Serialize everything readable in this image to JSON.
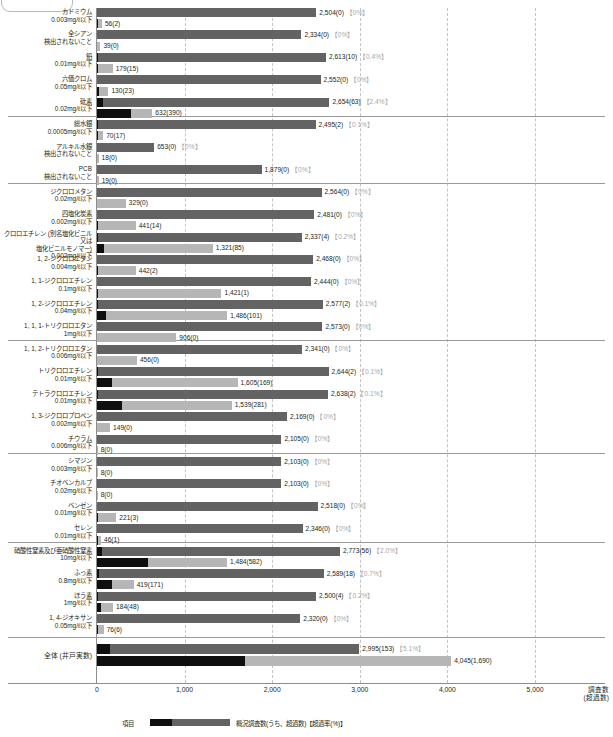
{
  "axis": {
    "ticks": [
      {
        "label": "0",
        "value": 0
      },
      {
        "label": "1,000",
        "value": 1000
      },
      {
        "label": "2,000",
        "value": 2000
      },
      {
        "label": "3,000",
        "value": 3000
      },
      {
        "label": "4,000",
        "value": 4000
      },
      {
        "label": "5,000",
        "value": 5000
      }
    ],
    "title_line1": "調査数",
    "title_line2": "(超過数)",
    "xmin": 0,
    "xmax": 5500
  },
  "legend": {
    "term": "項目",
    "text": "概況調査数(うち、超過数)【超過率(%)】"
  },
  "total": {
    "label": "全体 (井戸実数)",
    "survey_text": "2,995(153)",
    "survey_pct": "【5.1%】",
    "survey_value": 2995,
    "survey_exceed": 153,
    "detect_text": "4,045(1,690)",
    "detect_value": 4045,
    "detect_exceed": 1690
  },
  "colors": {
    "survey_bar": "#636363",
    "detect_bar": "#b6b6b6",
    "exceed_bar": "#0f0f0f",
    "gridline": "#c4c4c4",
    "axis": "#8d8d8d",
    "pct_text": "#a8a8a8"
  },
  "chart_data": {
    "type": "bar",
    "title": "",
    "xlabel": "調査数 (超過数)",
    "ylabel": "項目",
    "xlim": [
      0,
      5500
    ],
    "grid": true,
    "orientation": "horizontal",
    "series": [
      {
        "name": "概況調査数(うち、超過数)",
        "key": "survey"
      },
      {
        "name": "検出数(うち、超過数)",
        "key": "detect"
      }
    ],
    "categories": [
      "カドミウム",
      "全シアン",
      "鉛",
      "六価クロム",
      "砒素",
      "総水銀",
      "アルキル水銀",
      "PCB",
      "ジクロロメタン",
      "四塩化炭素",
      "クロロエチレン (別名塩化ビニル又は塩化ビニルモノマー)",
      "1, 2-ジクロロエタン",
      "1, 1-ジクロロエチレン",
      "1, 2-ジクロロエチレン",
      "1, 1, 1-トリクロロエタン",
      "1, 1, 2-トリクロロエタン",
      "トリクロロエチレン",
      "テトラクロロエチレン",
      "1, 3-ジクロロプロペン",
      "チウラム",
      "シマジン",
      "チオベンカルブ",
      "ベンゼン",
      "セレン",
      "硝酸性窒素及び亜硝酸性窒素",
      "ふっ素",
      "ほう素",
      "1, 4-ジオキサン",
      "全体 (井戸実数)"
    ],
    "rows": [
      {
        "name": "カドミウム",
        "std": "0.003mg/ℓ以下",
        "survey_value": 2504,
        "survey_exceed": 0,
        "survey_text": "2,504(0)",
        "survey_pct": "【0%】",
        "detect_value": 56,
        "detect_exceed": 2,
        "detect_text": "56(2)",
        "section": 0
      },
      {
        "name": "全シアン",
        "std": "検出されないこと",
        "survey_value": 2334,
        "survey_exceed": 0,
        "survey_text": "2,334(0)",
        "survey_pct": "【0%】",
        "detect_value": 39,
        "detect_exceed": 0,
        "detect_text": "39(0)",
        "section": 0
      },
      {
        "name": "鉛",
        "std": "0.01mg/ℓ以下",
        "survey_value": 2613,
        "survey_exceed": 10,
        "survey_text": "2,613(10)",
        "survey_pct": "【0.4%】",
        "detect_value": 179,
        "detect_exceed": 15,
        "detect_text": "179(15)",
        "section": 0
      },
      {
        "name": "六価クロム",
        "std": "0.05mg/ℓ以下",
        "survey_value": 2552,
        "survey_exceed": 0,
        "survey_text": "2,552(0)",
        "survey_pct": "【0%】",
        "detect_value": 130,
        "detect_exceed": 23,
        "detect_text": "130(23)",
        "section": 0
      },
      {
        "name": "砒素",
        "std": "0.02mg/ℓ以下",
        "survey_value": 2654,
        "survey_exceed": 63,
        "survey_text": "2,654(63)",
        "survey_pct": "【2.4%】",
        "detect_value": 632,
        "detect_exceed": 390,
        "detect_text": "632(390)",
        "section": 0
      },
      {
        "name": "総水銀",
        "std": "0.0005mg/ℓ以下",
        "survey_value": 2495,
        "survey_exceed": 2,
        "survey_text": "2,495(2)",
        "survey_pct": "【0.1%】",
        "detect_value": 70,
        "detect_exceed": 17,
        "detect_text": "70(17)",
        "section": 1
      },
      {
        "name": "アルキル水銀",
        "std": "検出されないこと",
        "survey_value": 653,
        "survey_exceed": 0,
        "survey_text": "653(0)",
        "survey_pct": "【0%】",
        "detect_value": 18,
        "detect_exceed": 0,
        "detect_text": "18(0)",
        "section": 1
      },
      {
        "name": "PCB",
        "std": "検出されないこと",
        "survey_value": 1879,
        "survey_exceed": 0,
        "survey_text": "1,879(0)",
        "survey_pct": "【0%】",
        "detect_value": 19,
        "detect_exceed": 0,
        "detect_text": "19(0)",
        "section": 1
      },
      {
        "name": "ジクロロメタン",
        "std": "0.02mg/ℓ以下",
        "survey_value": 2564,
        "survey_exceed": 0,
        "survey_text": "2,564(0)",
        "survey_pct": "【0%】",
        "detect_value": 329,
        "detect_exceed": 0,
        "detect_text": "329(0)",
        "section": 2
      },
      {
        "name": "四塩化炭素",
        "std": "0.002mg/ℓ以下",
        "survey_value": 2481,
        "survey_exceed": 0,
        "survey_text": "2,481(0)",
        "survey_pct": "【0%】",
        "detect_value": 441,
        "detect_exceed": 14,
        "detect_text": "441(14)",
        "section": 2
      },
      {
        "name": "クロロエチレン (別名塩化ビニル又は",
        "name2": "塩化ビニルモノマー)",
        "std": "0.002mg/ℓ以下",
        "survey_value": 2337,
        "survey_exceed": 4,
        "survey_text": "2,337(4)",
        "survey_pct": "【0.2%】",
        "detect_value": 1321,
        "detect_exceed": 85,
        "detect_text": "1,321(85)",
        "section": 2
      },
      {
        "name": "1, 2-ジクロロエタン",
        "std": "0.004mg/ℓ以下",
        "survey_value": 2468,
        "survey_exceed": 0,
        "survey_text": "2,468(0)",
        "survey_pct": "【0%】",
        "detect_value": 442,
        "detect_exceed": 2,
        "detect_text": "442(2)",
        "section": 2
      },
      {
        "name": "1, 1-ジクロロエチレン",
        "std": "0.1mg/ℓ以下",
        "survey_value": 2444,
        "survey_exceed": 0,
        "survey_text": "2,444(0)",
        "survey_pct": "【0%】",
        "detect_value": 1421,
        "detect_exceed": 1,
        "detect_text": "1,421(1)",
        "section": 2
      },
      {
        "name": "1, 2-ジクロロエチレン",
        "std": "0.04mg/ℓ以下",
        "survey_value": 2577,
        "survey_exceed": 2,
        "survey_text": "2,577(2)",
        "survey_pct": "【0.1%】",
        "detect_value": 1486,
        "detect_exceed": 101,
        "detect_text": "1,486(101)",
        "section": 2
      },
      {
        "name": "1, 1, 1-トリクロロエタン",
        "std": "1mg/ℓ以下",
        "survey_value": 2573,
        "survey_exceed": 0,
        "survey_text": "2,573(0)",
        "survey_pct": "【0%】",
        "detect_value": 906,
        "detect_exceed": 0,
        "detect_text": "906(0)",
        "section": 2
      },
      {
        "name": "1, 1, 2-トリクロロエタン",
        "std": "0.006mg/ℓ以下",
        "survey_value": 2341,
        "survey_exceed": 0,
        "survey_text": "2,341(0)",
        "survey_pct": "【0%】",
        "detect_value": 456,
        "detect_exceed": 0,
        "detect_text": "456(0)",
        "section": 3
      },
      {
        "name": "トリクロロエチレン",
        "std": "0.01mg/ℓ以下",
        "survey_value": 2644,
        "survey_exceed": 2,
        "survey_text": "2,644(2)",
        "survey_pct": "【0.1%】",
        "detect_value": 1605,
        "detect_exceed": 169,
        "detect_text": "1,605(169)",
        "section": 3
      },
      {
        "name": "テトラクロロエチレン",
        "std": "0.01mg/ℓ以下",
        "survey_value": 2638,
        "survey_exceed": 2,
        "survey_text": "2,638(2)",
        "survey_pct": "【0.1%】",
        "detect_value": 1539,
        "detect_exceed": 281,
        "detect_text": "1,539(281)",
        "section": 3
      },
      {
        "name": "1, 3-ジクロロプロペン",
        "std": "0.002mg/ℓ以下",
        "survey_value": 2169,
        "survey_exceed": 0,
        "survey_text": "2,169(0)",
        "survey_pct": "【0%】",
        "detect_value": 149,
        "detect_exceed": 0,
        "detect_text": "149(0)",
        "section": 3
      },
      {
        "name": "チウラム",
        "std": "0.006mg/ℓ以下",
        "survey_value": 2105,
        "survey_exceed": 0,
        "survey_text": "2,105(0)",
        "survey_pct": "【0%】",
        "detect_value": 8,
        "detect_exceed": 0,
        "detect_text": "8(0)",
        "section": 3
      },
      {
        "name": "シマジン",
        "std": "0.003mg/ℓ以下",
        "survey_value": 2103,
        "survey_exceed": 0,
        "survey_text": "2,103(0)",
        "survey_pct": "【0%】",
        "detect_value": 8,
        "detect_exceed": 0,
        "detect_text": "8(0)",
        "section": 4
      },
      {
        "name": "チオベンカルブ",
        "std": "0.02mg/ℓ以下",
        "survey_value": 2103,
        "survey_exceed": 0,
        "survey_text": "2,103(0)",
        "survey_pct": "【0%】",
        "detect_value": 8,
        "detect_exceed": 0,
        "detect_text": "8(0)",
        "section": 4
      },
      {
        "name": "ベンゼン",
        "std": "0.01mg/ℓ以下",
        "survey_value": 2518,
        "survey_exceed": 0,
        "survey_text": "2,518(0)",
        "survey_pct": "【0%】",
        "detect_value": 221,
        "detect_exceed": 3,
        "detect_text": "221(3)",
        "section": 4
      },
      {
        "name": "セレン",
        "std": "0.01mg/ℓ以下",
        "survey_value": 2346,
        "survey_exceed": 0,
        "survey_text": "2,346(0)",
        "survey_pct": "【0%】",
        "detect_value": 46,
        "detect_exceed": 1,
        "detect_text": "46(1)",
        "section": 4
      },
      {
        "name": "硝酸性窒素及び亜硝酸性窒素",
        "std": "10mg/ℓ以下",
        "survey_value": 2773,
        "survey_exceed": 56,
        "survey_text": "2,773(56)",
        "survey_pct": "【2.0%】",
        "detect_value": 1484,
        "detect_exceed": 582,
        "detect_text": "1,484(582)",
        "section": 5
      },
      {
        "name": "ふっ素",
        "std": "0.8mg/ℓ以下",
        "survey_value": 2589,
        "survey_exceed": 18,
        "survey_text": "2,589(18)",
        "survey_pct": "【0.7%】",
        "detect_value": 419,
        "detect_exceed": 171,
        "detect_text": "419(171)",
        "section": 5
      },
      {
        "name": "ほう素",
        "std": "1mg/ℓ以下",
        "survey_value": 2500,
        "survey_exceed": 4,
        "survey_text": "2,500(4)",
        "survey_pct": "【0.2%】",
        "detect_value": 184,
        "detect_exceed": 48,
        "detect_text": "184(48)",
        "section": 5
      },
      {
        "name": "1, 4-ジオキサン",
        "std": "0.05mg/ℓ以下",
        "survey_value": 2320,
        "survey_exceed": 0,
        "survey_text": "2,320(0)",
        "survey_pct": "【0%】",
        "detect_value": 76,
        "detect_exceed": 6,
        "detect_text": "76(6)",
        "section": 5
      }
    ]
  }
}
